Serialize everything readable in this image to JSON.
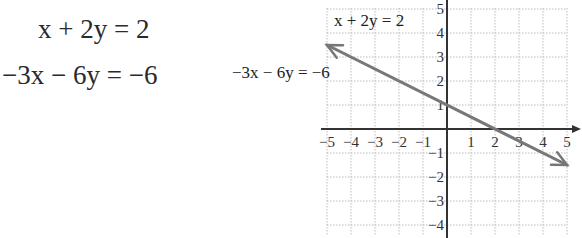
{
  "equations": {
    "eq1": "x + 2y = 2",
    "eq2": "−3x − 6y = −6"
  },
  "graph_labels": {
    "label1": "x + 2y = 2",
    "label2": "−3x − 6y = −6"
  },
  "chart_data": {
    "type": "line",
    "title": "",
    "xlabel": "",
    "ylabel": "",
    "xlim": [
      -5,
      5
    ],
    "ylim": [
      -4,
      5
    ],
    "grid": true,
    "x_ticks": [
      -5,
      -4,
      -3,
      -2,
      -1,
      1,
      2,
      3,
      4,
      5
    ],
    "y_ticks": [
      5,
      4,
      3,
      2,
      1,
      -1,
      -2,
      -3,
      -4
    ],
    "series": [
      {
        "name": "x + 2y = 2 and −3x − 6y = −6 (coincident lines)",
        "x": [
          -5,
          0,
          2,
          5
        ],
        "y": [
          3.5,
          1,
          0,
          -1.5
        ],
        "color": "#777777",
        "arrows": "both"
      }
    ],
    "annotations": [
      "x + 2y = 2",
      "−3x − 6y = −6"
    ]
  },
  "colors": {
    "line": "#777777",
    "grid": "#bbbbbb",
    "axis": "#333333"
  }
}
